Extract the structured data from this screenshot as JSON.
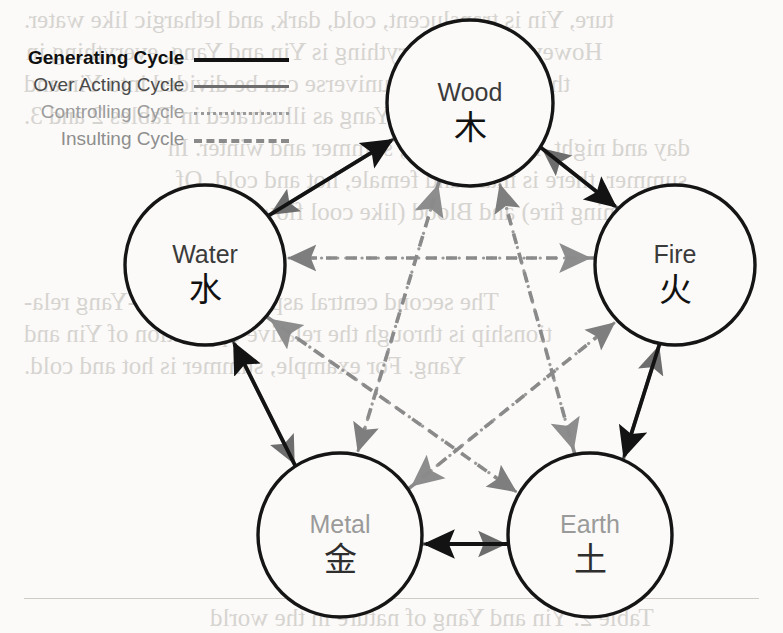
{
  "figure": {
    "background_color": "#fbfaf8"
  },
  "legend": {
    "items": [
      {
        "label": "Generating Cycle",
        "style": "solid-black",
        "color": "#131313"
      },
      {
        "label": "Over Acting Cycle",
        "style": "solid-gray",
        "color": "#6d6d6d"
      },
      {
        "label": "Controlling Cycle",
        "style": "dotted-gray",
        "color": "#9a9a9a"
      },
      {
        "label": "Insulting Cycle",
        "style": "dashed-gray",
        "color": "#8a8a8a"
      }
    ]
  },
  "nodes": [
    {
      "id": "wood",
      "name": "Wood",
      "han": "木",
      "cx": 470,
      "cy": 103,
      "r": 83,
      "faded": false
    },
    {
      "id": "water",
      "name": "Water",
      "han": "水",
      "cx": 205,
      "cy": 265,
      "r": 80,
      "faded": false
    },
    {
      "id": "fire",
      "name": "Fire",
      "han": "火",
      "cx": 675,
      "cy": 265,
      "r": 80,
      "faded": false
    },
    {
      "id": "metal",
      "name": "Metal",
      "han": "金",
      "cx": 340,
      "cy": 535,
      "r": 82,
      "faded": true
    },
    {
      "id": "earth",
      "name": "Earth",
      "han": "土",
      "cx": 590,
      "cy": 535,
      "r": 82,
      "faded": true
    }
  ],
  "edges": {
    "generating": {
      "cycle_name": "Generating Cycle",
      "color": "#131313",
      "links": [
        {
          "from": "water",
          "to": "wood"
        },
        {
          "from": "wood",
          "to": "fire"
        },
        {
          "from": "fire",
          "to": "earth"
        },
        {
          "from": "earth",
          "to": "metal"
        },
        {
          "from": "metal",
          "to": "water"
        }
      ]
    },
    "over_acting": {
      "cycle_name": "Over Acting Cycle",
      "color": "#6d6d6d",
      "links": [
        {
          "from": "wood",
          "to": "water"
        },
        {
          "from": "fire",
          "to": "wood"
        },
        {
          "from": "earth",
          "to": "fire"
        },
        {
          "from": "metal",
          "to": "earth"
        },
        {
          "from": "water",
          "to": "metal"
        }
      ]
    },
    "controlling": {
      "cycle_name": "Controlling Cycle",
      "color": "#9a9a9a",
      "links": [
        {
          "from": "wood",
          "to": "earth"
        },
        {
          "from": "earth",
          "to": "water"
        },
        {
          "from": "water",
          "to": "fire"
        },
        {
          "from": "fire",
          "to": "metal"
        },
        {
          "from": "metal",
          "to": "wood"
        }
      ]
    },
    "insulting": {
      "cycle_name": "Insulting Cycle",
      "color": "#8a8a8a",
      "links": [
        {
          "from": "earth",
          "to": "wood"
        },
        {
          "from": "water",
          "to": "earth"
        },
        {
          "from": "fire",
          "to": "water"
        },
        {
          "from": "metal",
          "to": "fire"
        },
        {
          "from": "wood",
          "to": "metal"
        }
      ]
    }
  },
  "bleed_text": [
    {
      "text": "ture, Yin is translucent, cold, dark, and lethargic like water.",
      "x": 24,
      "y": 6
    },
    {
      "text": "However, since everything is Yin and Yang, everything in",
      "x": 26,
      "y": 38
    },
    {
      "text": "the world and the universe can be divided into Yin and",
      "x": 24,
      "y": 70
    },
    {
      "text": "Yang as illustrated in Tables 2 and 3.",
      "x": 24,
      "y": 102
    },
    {
      "text": "day and night, life and death, summer and winter. In",
      "x": 168,
      "y": 134
    },
    {
      "text": "summer, there is male and female, hot and cold. Of",
      "x": 176,
      "y": 166
    },
    {
      "text": "like running fire) and Blood (like cool flowing water).",
      "x": 150,
      "y": 198
    },
    {
      "text": "The second central aspect of the Yin-Yang rela-",
      "x": 24,
      "y": 288
    },
    {
      "text": "tionship is through the relative opposition of Yin and",
      "x": 24,
      "y": 320
    },
    {
      "text": "Yang. For example, summer is hot and cold.",
      "x": 24,
      "y": 352
    },
    {
      "text": "Table 2. Yin and Yang of nature in the world",
      "x": 210,
      "y": 604
    }
  ]
}
